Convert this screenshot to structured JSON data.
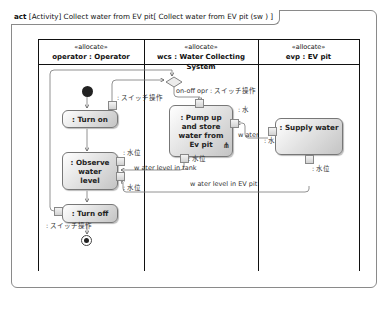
{
  "frame": {
    "kind": "act",
    "title": "[Activity] Collect water from EV pit[ Collect water from EV pit (sw ) ]"
  },
  "lanes": [
    {
      "stereotype": "«allocate»",
      "name": "operator : Operator"
    },
    {
      "stereotype": "«allocate»",
      "name": "wcs : Water Collecting System"
    },
    {
      "stereotype": "«allocate»",
      "name": "evp : EV pit"
    }
  ],
  "actions": {
    "turn_on": ": Turn on",
    "observe": ": Observe water level",
    "turn_off": ": Turn off",
    "pump": ": Pump up and store water from Ev pit",
    "supply": ": Supply water"
  },
  "labels": {
    "switch_op_1": ": スイッチ操作",
    "onoff_pin": "on-off opr : スイッチ操作",
    "pump_water_pin": ": 水",
    "water_flow": "w ater",
    "supply_water_pin": ": 水",
    "pump_level_pin": ": 水位",
    "level_in_tank": "w ater level in tank",
    "observe_pin_1": ": 水位",
    "observe_pin_2": ": 水位",
    "supply_level_pin": ": 水位",
    "level_in_pit": "w ater level in EV pit",
    "switch_op_2": ": スイッチ操作"
  },
  "icons": {
    "rake": "rake-icon",
    "initial": "initial-node-icon",
    "final": "activity-final-icon",
    "merge": "merge-node-icon"
  }
}
